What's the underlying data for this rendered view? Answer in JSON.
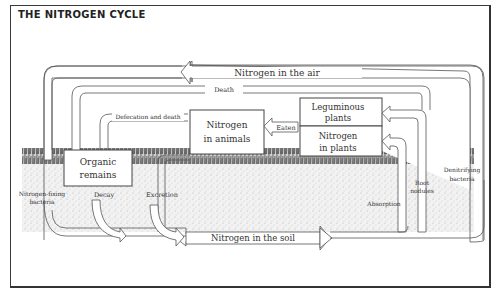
{
  "title": "THE NITROGEN CYCLE",
  "nodes": {
    "air": "Nitrogen in the air",
    "soil": "Nitrogen in the soil",
    "animals_line1": "Nitrogen",
    "animals_line2": "in animals",
    "organic_line1": "Organic",
    "organic_line2": "remains",
    "leguminous_line1": "Leguminous",
    "leguminous_line2": "plants",
    "plants_line1": "Nitrogen",
    "plants_line2": "in plants"
  },
  "flows": {
    "death": "Death",
    "defecation": "Defecation and death",
    "eaten": "Eaten",
    "decay": "Decay",
    "excretion": "Excretion",
    "absorption": "Absorption",
    "fixing_line1": "Nitrogen-fixing",
    "fixing_line2": "bacteria",
    "root_line1": "Root",
    "root_line2": "nodules",
    "denitrifying_line1": "Denitrifying",
    "denitrifying_line2": "bacteria"
  },
  "colors": {
    "stroke": "#555555",
    "soil": "#d9d9d9",
    "grass": "#3a3a3a"
  }
}
